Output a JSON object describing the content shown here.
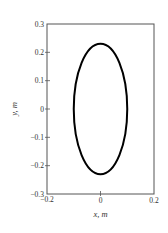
{
  "chart_data": {
    "type": "line",
    "title": "",
    "xlabel": "x, m",
    "ylabel": "y, m",
    "xlim": [
      -0.2,
      0.2
    ],
    "ylim": [
      -0.3,
      0.3
    ],
    "x_ticks": [
      -0.2,
      0,
      0.2
    ],
    "x_tick_labels": [
      "−0.2",
      "0",
      "0.2"
    ],
    "y_ticks": [
      0.3,
      0.2,
      0.1,
      0,
      -0.1,
      -0.2,
      -0.3
    ],
    "y_tick_labels": [
      "0.3",
      "0.2",
      "0.1",
      "0",
      "−0.1",
      "−0.2",
      "−0.3"
    ],
    "grid": false,
    "legend": null,
    "series": [
      {
        "name": "ellipse",
        "shape": "ellipse",
        "center": [
          0,
          0
        ],
        "semi_axis_x": 0.1,
        "semi_axis_y": 0.23,
        "color": "#000000",
        "line_width": 2
      }
    ]
  },
  "layout": {
    "plot_box": {
      "left": 47,
      "top": 24,
      "right": 154,
      "bottom": 194
    },
    "axis_color": "#555555",
    "curve_color": "#000000"
  }
}
